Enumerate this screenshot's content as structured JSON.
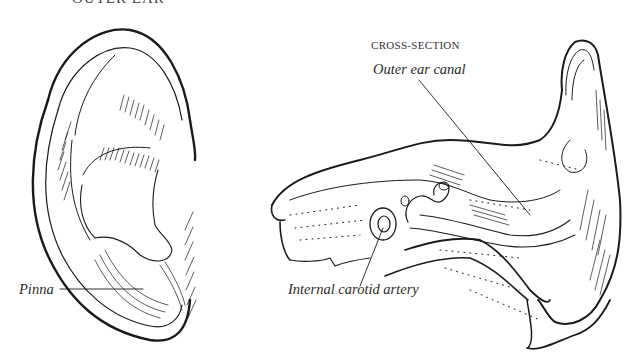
{
  "figure": {
    "title_fragment": "OUTER EAR",
    "left_panel": {
      "name": "external ear view",
      "labels": [
        {
          "text": "Pinna",
          "x": 19,
          "y": 282
        }
      ]
    },
    "right_panel": {
      "heading": "CROSS-SECTION",
      "labels": [
        {
          "text": "Outer ear canal",
          "x": 373,
          "y": 69
        },
        {
          "text": "Internal carotid artery",
          "x": 289,
          "y": 282
        }
      ]
    },
    "colors": {
      "ink": "#1a1a1a",
      "background": "#ffffff"
    }
  }
}
